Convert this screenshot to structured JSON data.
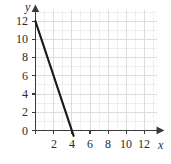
{
  "chart_data": {
    "type": "line",
    "title": "",
    "xlabel": "x",
    "ylabel": "y",
    "xlim": [
      0,
      13.5
    ],
    "ylim": [
      0,
      13.2
    ],
    "grid": true,
    "grid_minor_step": 1,
    "grid_major_step": 2,
    "legend": "none",
    "x_ticks": [
      0,
      2,
      4,
      6,
      8,
      10,
      12
    ],
    "y_ticks": [
      0,
      2,
      4,
      6,
      8,
      10,
      12
    ],
    "x_tick_labels": [
      "0",
      "2",
      "4",
      "6",
      "8",
      "10",
      "12"
    ],
    "y_tick_labels": [
      "0",
      "2",
      "4",
      "6",
      "8",
      "10",
      "12"
    ],
    "series": [
      {
        "name": "line",
        "equation": "y = -3x + 12",
        "slope": -3,
        "y_intercept": 12,
        "x_intercept": 4,
        "color": "#1a1a1a",
        "points": [
          {
            "x": 0,
            "y": 12
          },
          {
            "x": 4,
            "y": 0
          }
        ],
        "drawn_from": {
          "x": 0,
          "y": 12
        },
        "drawn_to": {
          "x": 4.2,
          "y": -0.6
        }
      }
    ],
    "axis_color": "#3a3a3a",
    "grid_color_minor": "#e9e9ec",
    "grid_color_major": "#dcdce1",
    "background": "#ffffff",
    "x_axis_arrow": true,
    "y_axis_arrow": true
  },
  "labels": {
    "y_axis_name": "y",
    "x_axis_name": "x",
    "origin": "0",
    "y": {
      "t12": "12",
      "t10": "10",
      "t8": "8",
      "t6": "6",
      "t4": "4",
      "t2": "2"
    },
    "x": {
      "t2": "2",
      "t4": "4",
      "t6": "6",
      "t8": "8",
      "t10": "10",
      "t12": "12"
    }
  }
}
